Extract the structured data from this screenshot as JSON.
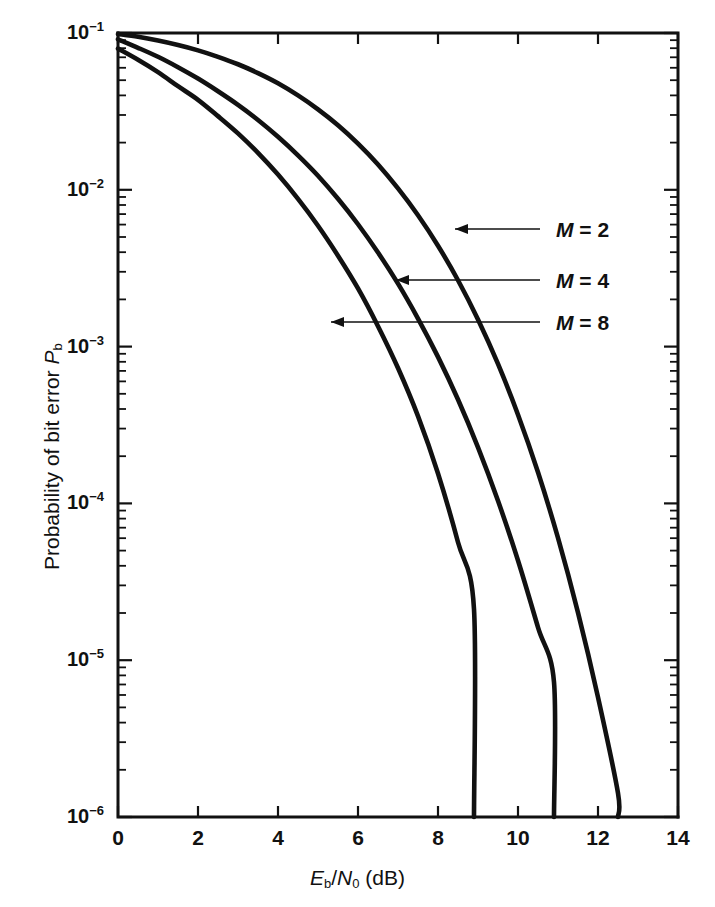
{
  "chart_data": {
    "type": "line",
    "title": "",
    "xlabel": "Eb/N0 (dB)",
    "ylabel": "Probability of bit error Pb",
    "xlabel_html": "<i>E</i><sub>b</sub>/<i>N</i><sub>0</sub> (dB)",
    "ylabel_html": "Probability of bit error <i>P</i><sub>b</sub>",
    "xlim": [
      0,
      14
    ],
    "ylim": [
      1e-06,
      0.1
    ],
    "yscale": "log",
    "xscale": "linear",
    "grid": false,
    "legend_position": "inline-annotations",
    "xticks": [
      0,
      2,
      4,
      6,
      8,
      10,
      12,
      14
    ],
    "xtick_labels": [
      "0",
      "2",
      "4",
      "6",
      "8",
      "10",
      "12",
      "14"
    ],
    "yticks": [
      0.1,
      0.01,
      0.001,
      0.0001,
      1e-05,
      1e-06
    ],
    "ytick_labels": [
      "10−1",
      "10−2",
      "10−3",
      "10−4",
      "10−5",
      "10−6"
    ],
    "ytick_mantissas": [
      "10",
      "10",
      "10",
      "10",
      "10",
      "10"
    ],
    "ytick_exponents": [
      "-1",
      "-2",
      "-3",
      "-4",
      "-5",
      "-6"
    ],
    "series": [
      {
        "name": "M = 2",
        "label_html": "<i>M</i> = 2",
        "x": [
          0,
          0.5,
          1,
          1.5,
          2,
          2.5,
          3,
          3.5,
          4,
          4.5,
          5,
          5.5,
          6,
          6.5,
          7,
          7.5,
          8,
          8.5,
          8.9
        ],
        "y": [
          0.0795,
          0.0675,
          0.0563,
          0.0458,
          0.0375,
          0.0295,
          0.0229,
          0.0172,
          0.0125,
          0.00875,
          0.0059,
          0.0038,
          0.00235,
          0.00135,
          0.00073,
          0.00036,
          0.000155,
          5.65e-05,
          2.12e-05
        ],
        "exit_x": 8.9,
        "exit_y": 1e-06
      },
      {
        "name": "M = 4",
        "label_html": "<i>M</i> = 4",
        "x": [
          0,
          0.5,
          1,
          1.5,
          2,
          2.5,
          3,
          3.5,
          4,
          4.5,
          5,
          5.5,
          6,
          6.5,
          7,
          7.5,
          8,
          8.5,
          9,
          9.5,
          10,
          10.5,
          10.9
        ],
        "y": [
          0.0912,
          0.0805,
          0.0705,
          0.0605,
          0.0512,
          0.0425,
          0.0348,
          0.0279,
          0.0218,
          0.0166,
          0.0123,
          0.00876,
          0.00603,
          0.00398,
          0.00252,
          0.00151,
          0.00086,
          0.00046,
          0.000228,
          0.000104,
          4.32e-05,
          1.62e-05,
          7.25e-06
        ],
        "exit_x": 10.9,
        "exit_y": 1e-06
      },
      {
        "name": "M = 8",
        "label_html": "<i>M</i> = 8",
        "x": [
          0,
          0.5,
          1,
          1.5,
          2,
          2.5,
          3,
          3.5,
          4,
          4.5,
          5,
          5.5,
          6,
          6.5,
          7,
          7.5,
          8,
          8.5,
          9,
          9.5,
          10,
          10.5,
          11,
          11.5,
          12,
          12.5
        ],
        "y": [
          0.0985,
          0.0945,
          0.0895,
          0.0838,
          0.0775,
          0.0705,
          0.0632,
          0.0555,
          0.0478,
          0.04,
          0.0326,
          0.0258,
          0.0197,
          0.0145,
          0.0102,
          0.00688,
          0.0044,
          0.00265,
          0.00149,
          0.000775,
          0.000368,
          0.000158,
          6.02e-05,
          2.01e-05,
          5.8e-06,
          1.42e-06
        ],
        "exit_x": 12.5,
        "exit_y": 1e-06
      }
    ],
    "annotations": [
      {
        "text": "M = 2",
        "text_html": "<i>M</i> = 2",
        "label_x_px": 556,
        "label_y_px": 218,
        "leader_from_px": 540,
        "leader_to_px": 455,
        "leader_y_px": 229,
        "arrow": true
      },
      {
        "text": "M = 4",
        "text_html": "<i>M</i> = 4",
        "label_x_px": 556,
        "label_y_px": 269,
        "leader_from_px": 540,
        "leader_to_px": 396,
        "leader_y_px": 280,
        "arrow": true
      },
      {
        "text": "M = 8",
        "text_html": "<i>M</i> = 8",
        "label_x_px": 556,
        "label_y_px": 311,
        "leader_from_px": 540,
        "leader_to_px": 331,
        "leader_y_px": 322,
        "arrow": true
      }
    ]
  },
  "axes": {
    "x_title": "Eb/N0 (dB)",
    "y_title": "Probability of bit error Pb"
  }
}
